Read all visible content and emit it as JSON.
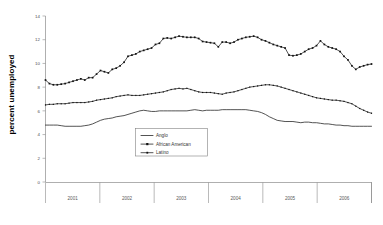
{
  "chart_data": {
    "type": "line",
    "title": "",
    "subtitle": "",
    "xlabel": "",
    "ylabel": "percent unemployed",
    "ylim": [
      0,
      14
    ],
    "yticks": [
      0,
      2,
      4,
      6,
      8,
      10,
      12,
      14
    ],
    "ytick_labels": [
      "0",
      "2",
      "4",
      "6",
      "8",
      "10",
      "12",
      "14"
    ],
    "grid": false,
    "legend_position": "center-left-inside",
    "xtick_labels": [
      "2001",
      "2002",
      "2003",
      "2004",
      "2005",
      "2006"
    ],
    "x_note": "monthly observations grouped by calendar year 2001-2006",
    "series": [
      {
        "name": "Anglo",
        "marker": "none",
        "values": [
          4.8,
          4.8,
          4.8,
          4.8,
          4.75,
          4.7,
          4.7,
          4.7,
          4.7,
          4.7,
          4.75,
          4.8,
          4.9,
          5.05,
          5.2,
          5.3,
          5.35,
          5.4,
          5.5,
          5.55,
          5.6,
          5.7,
          5.8,
          5.9,
          6.0,
          6.05,
          6.0,
          5.95,
          5.95,
          6.0,
          6.0,
          6.0,
          6.0,
          6.0,
          6.0,
          6.0,
          6.0,
          6.05,
          6.1,
          6.05,
          6.0,
          6.05,
          6.05,
          6.05,
          6.05,
          6.1,
          6.1,
          6.1,
          6.1,
          6.1,
          6.1,
          6.1,
          6.05,
          6.0,
          5.95,
          5.85,
          5.7,
          5.5,
          5.35,
          5.2,
          5.15,
          5.1,
          5.1,
          5.1,
          5.05,
          5.0,
          5.05,
          5.05,
          5.0,
          5.0,
          4.95,
          4.9,
          4.9,
          4.85,
          4.8,
          4.8,
          4.75,
          4.75,
          4.7,
          4.7,
          4.7,
          4.7,
          4.7,
          4.7
        ]
      },
      {
        "name": "African American",
        "marker": "square",
        "values": [
          8.6,
          8.3,
          8.2,
          8.2,
          8.25,
          8.3,
          8.4,
          8.5,
          8.6,
          8.7,
          8.6,
          8.8,
          8.8,
          9.1,
          9.4,
          9.3,
          9.2,
          9.5,
          9.6,
          9.8,
          10.1,
          10.6,
          10.7,
          10.8,
          11.0,
          11.1,
          11.2,
          11.3,
          11.6,
          11.7,
          12.1,
          12.15,
          12.1,
          12.2,
          12.3,
          12.25,
          12.2,
          12.2,
          12.2,
          12.1,
          11.85,
          11.8,
          11.75,
          11.7,
          11.4,
          11.8,
          11.8,
          11.7,
          11.8,
          12.0,
          12.1,
          12.2,
          12.25,
          12.3,
          12.2,
          12.0,
          11.9,
          11.75,
          11.6,
          11.5,
          11.4,
          11.3,
          10.7,
          10.65,
          10.7,
          10.8,
          11.0,
          11.2,
          11.3,
          11.5,
          11.9,
          11.6,
          11.4,
          11.3,
          11.2,
          11.0,
          10.6,
          10.3,
          9.8,
          9.5,
          9.7,
          9.8,
          9.9,
          9.95
        ]
      },
      {
        "name": "Latino",
        "marker": "dot",
        "values": [
          6.5,
          6.55,
          6.55,
          6.6,
          6.6,
          6.6,
          6.65,
          6.7,
          6.7,
          6.7,
          6.7,
          6.75,
          6.8,
          6.9,
          6.95,
          7.0,
          7.05,
          7.1,
          7.2,
          7.25,
          7.3,
          7.35,
          7.3,
          7.3,
          7.3,
          7.35,
          7.4,
          7.45,
          7.5,
          7.55,
          7.6,
          7.7,
          7.8,
          7.85,
          7.9,
          7.85,
          7.9,
          7.8,
          7.7,
          7.6,
          7.55,
          7.55,
          7.55,
          7.5,
          7.45,
          7.4,
          7.5,
          7.55,
          7.6,
          7.7,
          7.8,
          7.9,
          8.0,
          8.05,
          8.1,
          8.15,
          8.2,
          8.2,
          8.15,
          8.1,
          8.0,
          7.9,
          7.8,
          7.7,
          7.6,
          7.5,
          7.4,
          7.3,
          7.2,
          7.1,
          7.05,
          7.0,
          6.95,
          6.9,
          6.9,
          6.85,
          6.8,
          6.7,
          6.6,
          6.4,
          6.2,
          6.05,
          5.9,
          5.8
        ]
      }
    ]
  },
  "axis": {
    "y_axis_title": "percent unemployed"
  },
  "legend": {
    "entries": [
      {
        "label": "Anglo"
      },
      {
        "label": "African American"
      },
      {
        "label": "Latino"
      }
    ]
  },
  "colors": {
    "background": "#ffffff",
    "line": "#1a1a1a",
    "axis": "#8c8c8c",
    "text": "#333333"
  }
}
